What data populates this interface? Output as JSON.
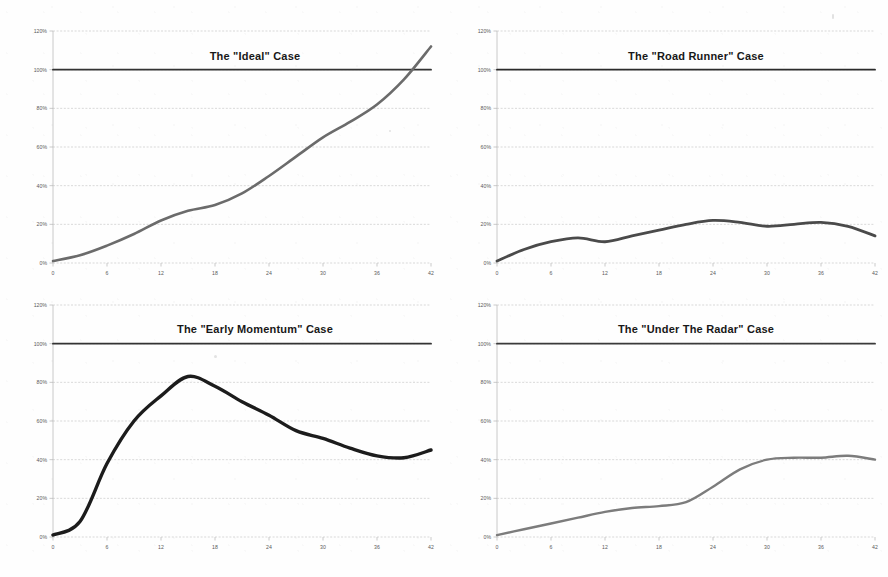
{
  "page": {
    "background_color": "#fefefe",
    "grid_columns": 2,
    "grid_rows": 2
  },
  "axis": {
    "y_ticks": [
      "0%",
      "20%",
      "40%",
      "60%",
      "80%",
      "100%",
      "120%"
    ],
    "y_values": [
      0,
      20,
      40,
      60,
      80,
      100,
      120
    ],
    "x_ticks": [
      "0",
      "6",
      "12",
      "18",
      "24",
      "30",
      "36",
      "42"
    ],
    "x_values": [
      0,
      6,
      12,
      18,
      24,
      30,
      36,
      42
    ],
    "ylim": [
      0,
      120
    ],
    "xlim": [
      0,
      42
    ],
    "grid": true,
    "grid_color": "#c9c9c9",
    "tick_label_color": "#5a5a5a"
  },
  "chart_data": [
    {
      "id": "ideal",
      "position": "top-left",
      "type": "line",
      "title": "The \"Ideal\" Case",
      "xlabel": "",
      "ylabel": "",
      "xlim": [
        0,
        42
      ],
      "ylim": [
        0,
        120
      ],
      "grid": true,
      "legend": "none",
      "line_color": "#6b6b6b",
      "line_width": 2.6,
      "reference_color": "#333333",
      "series": [
        {
          "name": "reference-100",
          "role": "reference",
          "color": "#333333",
          "x": [
            0,
            42
          ],
          "values": [
            100,
            100
          ]
        },
        {
          "name": "adoption",
          "role": "data",
          "color": "#6b6b6b",
          "x": [
            0,
            3,
            6,
            9,
            12,
            15,
            18,
            21,
            24,
            27,
            30,
            33,
            36,
            39,
            42
          ],
          "values": [
            1,
            4,
            9,
            15,
            22,
            27,
            30,
            36,
            45,
            55,
            65,
            73,
            82,
            95,
            112
          ]
        }
      ]
    },
    {
      "id": "road-runner",
      "position": "top-right",
      "type": "line",
      "title": "The \"Road Runner\" Case",
      "xlabel": "",
      "ylabel": "",
      "xlim": [
        0,
        42
      ],
      "ylim": [
        0,
        120
      ],
      "grid": true,
      "legend": "none",
      "line_color": "#4a4a4a",
      "line_width": 2.8,
      "reference_color": "#2b2b2b",
      "series": [
        {
          "name": "reference-100",
          "role": "reference",
          "color": "#2b2b2b",
          "x": [
            0,
            42
          ],
          "values": [
            100,
            100
          ]
        },
        {
          "name": "adoption",
          "role": "data",
          "color": "#4a4a4a",
          "x": [
            0,
            3,
            6,
            9,
            12,
            15,
            18,
            21,
            24,
            27,
            30,
            33,
            36,
            39,
            42
          ],
          "values": [
            1,
            7,
            11,
            13,
            11,
            14,
            17,
            20,
            22,
            21,
            19,
            20,
            21,
            19,
            14
          ]
        }
      ]
    },
    {
      "id": "early-momentum",
      "position": "bottom-left",
      "type": "line",
      "title": "The \"Early Momentum\" Case",
      "xlabel": "",
      "ylabel": "",
      "xlim": [
        0,
        42
      ],
      "ylim": [
        0,
        120
      ],
      "grid": true,
      "legend": "none",
      "line_color": "#1c1c1c",
      "line_width": 3.4,
      "reference_color": "#333333",
      "series": [
        {
          "name": "reference-100",
          "role": "reference",
          "color": "#333333",
          "x": [
            0,
            42
          ],
          "values": [
            100,
            100
          ]
        },
        {
          "name": "adoption",
          "role": "data",
          "color": "#1c1c1c",
          "x": [
            0,
            3,
            6,
            9,
            12,
            15,
            18,
            21,
            24,
            27,
            30,
            33,
            36,
            39,
            42
          ],
          "values": [
            1,
            8,
            38,
            60,
            73,
            83,
            78,
            70,
            63,
            55,
            51,
            46,
            42,
            41,
            45
          ]
        }
      ]
    },
    {
      "id": "under-the-radar",
      "position": "bottom-right",
      "type": "line",
      "title": "The \"Under The Radar\" Case",
      "xlabel": "",
      "ylabel": "",
      "xlim": [
        0,
        42
      ],
      "ylim": [
        0,
        120
      ],
      "grid": true,
      "legend": "none",
      "line_color": "#7c7c7c",
      "line_width": 2.4,
      "reference_color": "#3a3a3a",
      "series": [
        {
          "name": "reference-100",
          "role": "reference",
          "color": "#3a3a3a",
          "x": [
            0,
            42
          ],
          "values": [
            100,
            100
          ]
        },
        {
          "name": "adoption",
          "role": "data",
          "color": "#7c7c7c",
          "x": [
            0,
            3,
            6,
            9,
            12,
            15,
            18,
            21,
            24,
            27,
            30,
            33,
            36,
            39,
            42
          ],
          "values": [
            1,
            4,
            7,
            10,
            13,
            15,
            16,
            18,
            26,
            35,
            40,
            41,
            41,
            42,
            40
          ]
        }
      ]
    }
  ]
}
